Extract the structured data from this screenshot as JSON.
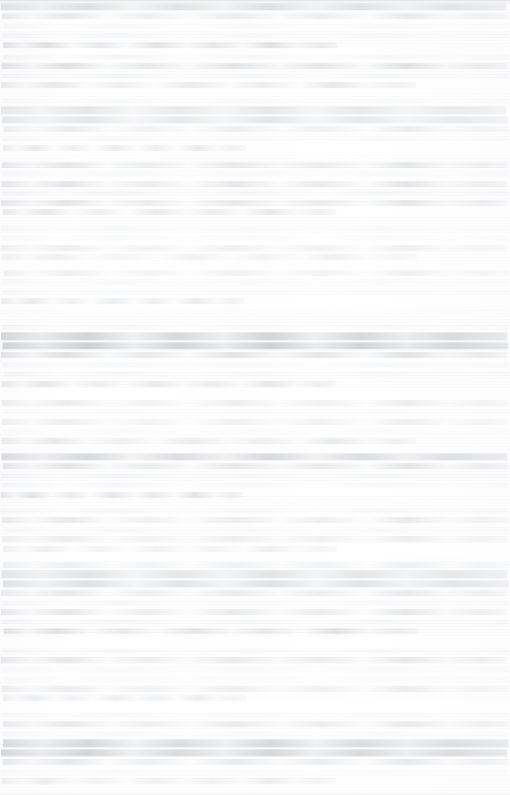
{
  "document": {
    "legibility": "illegible",
    "condition_note": "Severely faded and horizontally streaked scan; no glyphs resolve at any magnification.",
    "page_width_px": 510,
    "page_height_px": 795,
    "orientation": "portrait",
    "column_count": 1,
    "text_alignment": "justified",
    "content_left_px": 2,
    "content_right_px": 508,
    "line_pitch_px": 9.5,
    "colors": {
      "paper": "#fdfdfd",
      "ink_darkest": "#b4b9c0",
      "ink_typical": "#d8dade",
      "ink_faintest": "#eef0f2",
      "edge_rule": "#b2b7be"
    },
    "visible_text": [],
    "blocks": [
      {
        "id": "block-1",
        "top": 2,
        "line_height": 9.5,
        "lines": [
          "strong",
          "normal",
          "faint",
          "faint",
          "short"
        ]
      },
      {
        "id": "block-2",
        "top": 52,
        "line_height": 9.5,
        "lines": [
          "faint",
          "normal",
          "faint",
          "short2"
        ]
      },
      {
        "id": "block-3",
        "top": 96,
        "line_height": 9.5,
        "lines": [
          "faint",
          "strong",
          "strong",
          "normal",
          "faint",
          "short3"
        ]
      },
      {
        "id": "block-4",
        "top": 160,
        "line_height": 9.5,
        "lines": [
          "normal",
          "faint",
          "normal",
          "faint",
          "normal",
          "short"
        ]
      },
      {
        "id": "block-5",
        "top": 224,
        "line_height": 9.5,
        "lines": [
          "faint",
          "faint",
          "normal",
          "short2"
        ]
      },
      {
        "id": "block-6",
        "top": 268,
        "line_height": 9.5,
        "lines": [
          "normal",
          "faint",
          "faint",
          "short3"
        ]
      },
      {
        "id": "block-7",
        "top": 322,
        "line_height": 9.5,
        "lines": [
          "faint",
          "strong",
          "strong",
          "normal",
          "faint",
          "faint",
          "short"
        ]
      },
      {
        "id": "block-8",
        "top": 398,
        "line_height": 9.5,
        "lines": [
          "normal",
          "faint",
          "normal",
          "faint",
          "short2"
        ]
      },
      {
        "id": "block-9",
        "top": 452,
        "line_height": 9.5,
        "lines": [
          "strong",
          "normal",
          "faint",
          "faint",
          "short3"
        ]
      },
      {
        "id": "block-10",
        "top": 506,
        "line_height": 9.5,
        "lines": [
          "faint",
          "normal",
          "faint",
          "normal",
          "short"
        ]
      },
      {
        "id": "block-11",
        "top": 560,
        "line_height": 9.5,
        "lines": [
          "normal",
          "strong",
          "strong",
          "normal",
          "faint",
          "normal",
          "faint",
          "short2"
        ]
      },
      {
        "id": "block-12",
        "top": 646,
        "line_height": 9.5,
        "lines": [
          "faint",
          "normal",
          "faint",
          "faint",
          "normal",
          "short3"
        ]
      },
      {
        "id": "block-13",
        "top": 710,
        "line_height": 9.5,
        "lines": [
          "faint",
          "normal",
          "faint",
          "strong",
          "strong",
          "normal",
          "faint",
          "short"
        ]
      }
    ]
  }
}
